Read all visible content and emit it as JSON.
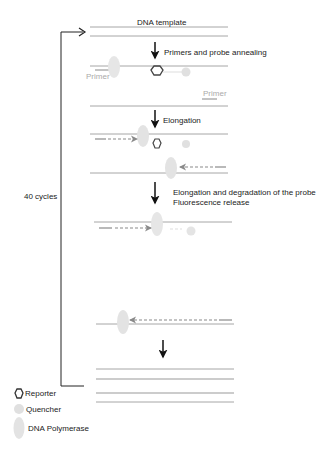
{
  "diagram": {
    "type": "qPCR TaqMan probe mechanism",
    "steps": [
      {
        "label": "DNA template"
      },
      {
        "label": "Primers and probe annealing"
      },
      {
        "label": "Elongation"
      },
      {
        "label": "Elongation and degradation of the probe"
      },
      {
        "label": "Fluorescence release"
      }
    ],
    "primer_labels": [
      "Primer",
      "Primer"
    ],
    "cycle_label": "40 cycles",
    "legend": [
      {
        "icon": "hexagon-outline",
        "label": "Reporter"
      },
      {
        "icon": "grey-circle",
        "label": "Quencher"
      },
      {
        "icon": "grey-ellipse",
        "label": "DNA Polymerase"
      }
    ],
    "colors": {
      "strand": "#a6a6a6",
      "arrow": "#111111",
      "primer_arrow": "#8a8a8a",
      "polymerase": "#e3e3e3",
      "quencher": "#e0e0e0",
      "reporter": "#444444"
    }
  }
}
